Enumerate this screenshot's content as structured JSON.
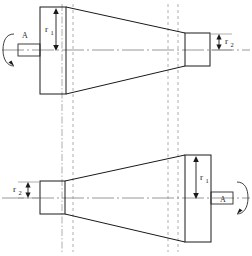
{
  "figure": {
    "caption": "",
    "background_color": "#ffffff",
    "line_color": "#1a1a1a",
    "construction_line_color": "#9a9a9a",
    "centerline_color": "#8c8c8c"
  },
  "top_view": {
    "name": "upper-frustum-view",
    "rotation_label": "A",
    "big_radius_label": "r",
    "big_radius_subscript": "1",
    "small_radius_label": "r",
    "small_radius_subscript": "2",
    "centerline_y": 50,
    "base_rect": {
      "x": 40,
      "y": 7,
      "width": 26,
      "height": 87
    },
    "tip_rect": {
      "x": 185,
      "y": 33,
      "width": 25,
      "height": 33
    },
    "shaft_rect": {
      "x": 18,
      "y": 44,
      "width": 22,
      "height": 12
    },
    "cone_top": {
      "x1": 66,
      "y1": 7,
      "x2": 185,
      "y2": 33
    },
    "cone_bottom": {
      "x1": 66,
      "y1": 94,
      "x2": 185,
      "y2": 66
    }
  },
  "bottom_view": {
    "name": "lower-frustum-view",
    "rotation_label": "A",
    "big_radius_label": "r",
    "big_radius_subscript": "1",
    "small_radius_label": "r",
    "small_radius_subscript": "2",
    "centerline_y": 198,
    "base_rect": {
      "x": 185,
      "y": 155,
      "width": 26,
      "height": 87
    },
    "tip_rect": {
      "x": 40,
      "y": 181,
      "width": 25,
      "height": 33
    },
    "shaft_rect": {
      "x": 211,
      "y": 192,
      "width": 22,
      "height": 12
    },
    "cone_top": {
      "x1": 65,
      "y1": 181,
      "x2": 185,
      "y2": 155
    },
    "cone_bottom": {
      "x1": 65,
      "y1": 214,
      "x2": 185,
      "y2": 242
    }
  },
  "projection_lines": [
    {
      "name": "proj-left-outer",
      "x": 62
    },
    {
      "name": "proj-left-inner",
      "x": 73
    },
    {
      "name": "proj-right-inner",
      "x": 168
    },
    {
      "name": "proj-right-outer",
      "x": 178
    }
  ],
  "dimensions": [
    {
      "name": "top-r1",
      "label": "r",
      "subscript": "1",
      "view": "top",
      "from_y": 10,
      "to_y": 50,
      "x": 56
    },
    {
      "name": "top-r2",
      "label": "r",
      "subscript": "2",
      "view": "top",
      "from_y": 36,
      "to_y": 50,
      "x": 219
    },
    {
      "name": "bottom-r1",
      "label": "r",
      "subscript": "1",
      "view": "bottom",
      "from_y": 158,
      "to_y": 198,
      "x": 196
    },
    {
      "name": "bottom-r2",
      "label": "r",
      "subscript": "2",
      "view": "bottom",
      "from_y": 184,
      "to_y": 198,
      "x": 28
    }
  ]
}
